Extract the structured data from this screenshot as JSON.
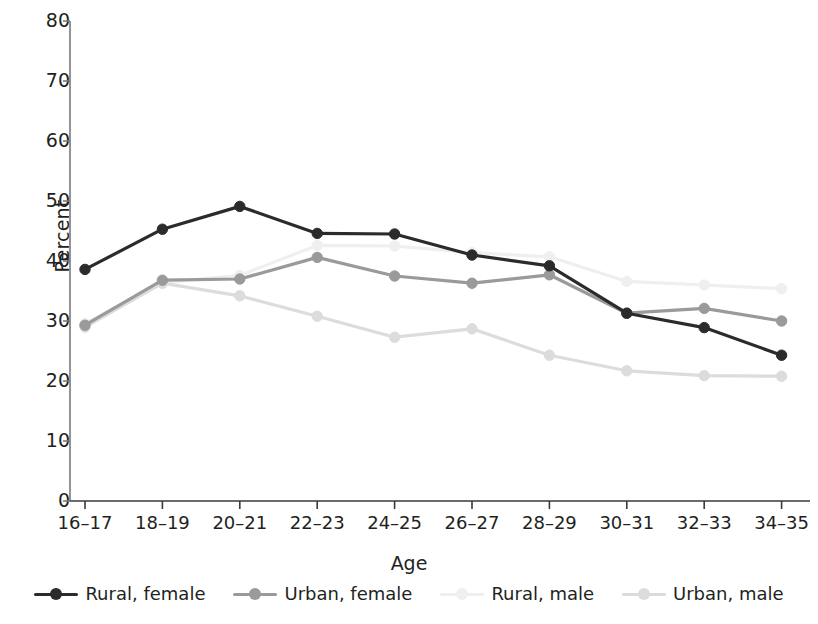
{
  "chart_data": {
    "type": "line",
    "title": "",
    "xlabel": "Age",
    "ylabel": "Percent",
    "categories": [
      "16–17",
      "18–19",
      "20–21",
      "22–23",
      "24–25",
      "26–27",
      "28–29",
      "30–31",
      "32–33",
      "34–35"
    ],
    "ylim": [
      0,
      80
    ],
    "yticks": [
      0,
      10,
      20,
      30,
      40,
      50,
      60,
      70,
      80
    ],
    "grid": false,
    "legend_position": "bottom",
    "series": [
      {
        "name": "Rural, female",
        "color": "#2b2b2b",
        "values": [
          38.6,
          45.3,
          49.1,
          44.6,
          44.5,
          41.0,
          39.2,
          31.3,
          28.9,
          24.3
        ]
      },
      {
        "name": "Urban, female",
        "color": "#9a9a9a",
        "values": [
          29.3,
          36.8,
          37.0,
          40.6,
          37.5,
          36.3,
          37.7,
          31.3,
          32.1,
          30.0
        ]
      },
      {
        "name": "Rural, male",
        "color": "#efefef",
        "values": [
          29.6,
          36.4,
          37.6,
          42.6,
          42.5,
          41.4,
          40.7,
          36.6,
          36.0,
          35.4
        ]
      },
      {
        "name": "Urban, male",
        "color": "#dcdcdc",
        "values": [
          29.0,
          36.3,
          34.2,
          30.8,
          27.3,
          28.7,
          24.3,
          21.7,
          20.9,
          20.8
        ]
      }
    ]
  },
  "axis": {
    "y_title": "Percent",
    "x_title": "Age",
    "y_labels": [
      "80",
      "70",
      "60",
      "50",
      "40",
      "30",
      "20",
      "10",
      "0"
    ],
    "x_labels": [
      "16–17",
      "18–19",
      "20–21",
      "22–23",
      "24–25",
      "26–27",
      "28–29",
      "30–31",
      "32–33",
      "34–35"
    ]
  },
  "legend": {
    "items": [
      {
        "label": "Rural, female",
        "color": "#2b2b2b"
      },
      {
        "label": "Urban, female",
        "color": "#9a9a9a"
      },
      {
        "label": "Rural, male",
        "color": "#efefef"
      },
      {
        "label": "Urban, male",
        "color": "#dcdcdc"
      }
    ]
  }
}
